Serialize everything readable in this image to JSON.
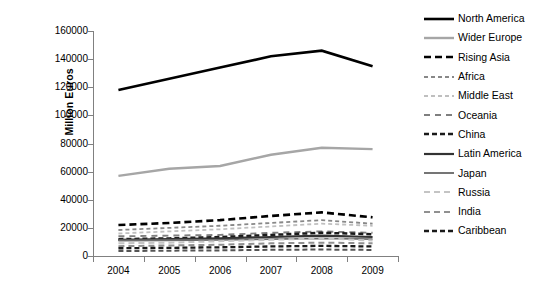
{
  "chart_data": {
    "type": "line",
    "title": "",
    "xlabel": "",
    "ylabel": "Million Euros",
    "categories": [
      "2004",
      "2005",
      "2006",
      "2007",
      "2008",
      "2009"
    ],
    "ylim": [
      0,
      160000
    ],
    "ytick_step": 20000,
    "yticks": [
      "0",
      "20000",
      "40000",
      "60000",
      "80000",
      "100000",
      "120000",
      "140000",
      "160000"
    ],
    "grid": false,
    "legend_position": "right",
    "series": [
      {
        "name": "North America",
        "values": [
          118000,
          126000,
          134000,
          142000,
          146000,
          135000
        ],
        "color": "#000000",
        "style": "solid",
        "width": 2.6,
        "dash": ""
      },
      {
        "name": "Wider Europe",
        "values": [
          57000,
          62000,
          64000,
          72000,
          77000,
          76000
        ],
        "color": "#A6A6A6",
        "style": "solid",
        "width": 2.4,
        "dash": ""
      },
      {
        "name": "Rising Asia",
        "values": [
          22000,
          23500,
          25500,
          28500,
          31000,
          27500
        ],
        "color": "#000000",
        "style": "dashed",
        "width": 2.6,
        "dash": "7,4"
      },
      {
        "name": "Africa",
        "values": [
          18500,
          20000,
          21500,
          23500,
          25500,
          23000
        ],
        "color": "#888888",
        "style": "dashed",
        "width": 1.8,
        "dash": "4,3"
      },
      {
        "name": "Middle East",
        "values": [
          16000,
          17500,
          19000,
          21000,
          23000,
          21500
        ],
        "color": "#BFBFBF",
        "style": "dashed",
        "width": 1.8,
        "dash": "4,3"
      },
      {
        "name": "Oceania",
        "values": [
          14000,
          14500,
          15000,
          16500,
          17500,
          16500
        ],
        "color": "#7F7F7F",
        "style": "dashed",
        "width": 1.9,
        "dash": "6,5"
      },
      {
        "name": "China",
        "values": [
          12000,
          12500,
          13500,
          15000,
          16500,
          15500
        ],
        "color": "#1A1A1A",
        "style": "dashed",
        "width": 2.5,
        "dash": "5,3"
      },
      {
        "name": "Latin America",
        "values": [
          11500,
          12000,
          12500,
          13500,
          14500,
          13500
        ],
        "color": "#333333",
        "style": "solid",
        "width": 2.2,
        "dash": ""
      },
      {
        "name": "Japan",
        "values": [
          11000,
          11200,
          11500,
          12000,
          12500,
          12000
        ],
        "color": "#6E6E6E",
        "style": "solid",
        "width": 1.9,
        "dash": ""
      },
      {
        "name": "Russia",
        "values": [
          9000,
          9500,
          10500,
          11500,
          12500,
          11000
        ],
        "color": "#C4C4C4",
        "style": "dashed",
        "width": 2.0,
        "dash": "6,4"
      },
      {
        "name": "India",
        "values": [
          7000,
          7500,
          8000,
          9000,
          9500,
          9000
        ],
        "color": "#909090",
        "style": "dashed",
        "width": 2.0,
        "dash": "6,4"
      },
      {
        "name": "Caribbean",
        "values": [
          5500,
          5800,
          6200,
          6800,
          7200,
          6800
        ],
        "color": "#1A1A1A",
        "style": "dashed",
        "width": 2.3,
        "dash": "5,3"
      },
      {
        "name": "Lower band",
        "values": [
          3500,
          3800,
          4000,
          4400,
          4600,
          4300
        ],
        "color": "#555555",
        "style": "dashed",
        "width": 2.0,
        "dash": "5,3"
      }
    ]
  },
  "legend": {
    "items": [
      {
        "label": "North America"
      },
      {
        "label": "Wider Europe"
      },
      {
        "label": "Rising Asia"
      },
      {
        "label": "Africa"
      },
      {
        "label": "Middle East"
      },
      {
        "label": "Oceania"
      },
      {
        "label": "China"
      },
      {
        "label": "Latin America"
      },
      {
        "label": "Japan"
      },
      {
        "label": "Russia"
      },
      {
        "label": "India"
      },
      {
        "label": "Caribbean"
      }
    ]
  }
}
